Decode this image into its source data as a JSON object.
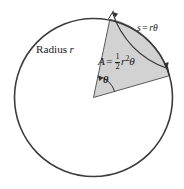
{
  "figure": {
    "background_color": "#ffffff",
    "circle": {
      "center_x": 93.5,
      "center_y": 97.5,
      "radius": 79,
      "stroke_color": "#3b3b3b",
      "stroke_width": 1.6,
      "fill": "none"
    },
    "sector": {
      "fill_color": "#d2d2d2",
      "stroke_color": "#5a5a5a",
      "stroke_width": 1.0,
      "start_angle_deg": 16,
      "end_angle_deg": 78,
      "apex_x": 93.5,
      "apex_y": 97.5
    },
    "arc_arrow": {
      "stroke_color": "#2e2e2e",
      "stroke_width": 1.1,
      "offset_radius": 86,
      "start_angle_deg": 14,
      "end_angle_deg": 80,
      "double_headed": true
    },
    "theta_arc": {
      "stroke_color": "#2e2e2e",
      "stroke_width": 1.0,
      "radius": 22
    }
  },
  "labels": {
    "radius": {
      "word": "Radius",
      "variable": "r"
    },
    "area": {
      "lhs": "A",
      "equals": "=",
      "fraction_numerator": "1",
      "fraction_denominator": "2",
      "variable": "r",
      "exponent": "2",
      "angle_symbol": "θ"
    },
    "arc_length": {
      "lhs": "s",
      "equals": "=",
      "rhs": "rθ"
    },
    "angle": {
      "symbol": "θ"
    }
  }
}
